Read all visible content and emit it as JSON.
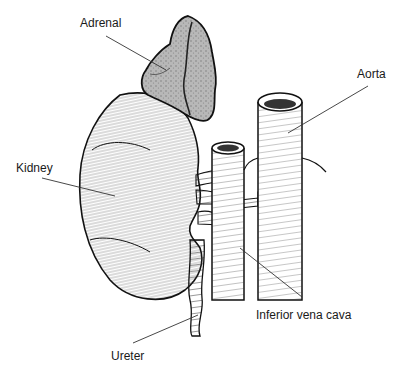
{
  "diagram": {
    "style": "black-and-white pen-and-ink anatomical illustration",
    "labels": [
      {
        "id": "adrenal",
        "text": "Adrenal",
        "x": 80,
        "y": 17,
        "pointer": [
          [
            106,
            36
          ],
          [
            166,
            70
          ]
        ]
      },
      {
        "id": "aorta",
        "text": "Aorta",
        "x": 357,
        "y": 68,
        "pointer": [
          [
            368,
            86
          ],
          [
            288,
            133
          ]
        ]
      },
      {
        "id": "kidney",
        "text": "Kidney",
        "x": 16,
        "y": 162,
        "pointer": [
          [
            42,
            178
          ],
          [
            115,
            196
          ]
        ]
      },
      {
        "id": "ivc",
        "text": "Inferior vena cava",
        "x": 256,
        "y": 309,
        "pointer": [
          [
            302,
            297
          ],
          [
            240,
            248
          ]
        ]
      },
      {
        "id": "ureter",
        "text": "Ureter",
        "x": 111,
        "y": 350,
        "pointer": [
          [
            133,
            343
          ],
          [
            198,
            315
          ]
        ]
      }
    ]
  },
  "colors": {
    "ink": "#111111",
    "adrenal_fill": "#9a9a9a",
    "adrenal_light": "#cfcfcf",
    "background": "#ffffff",
    "pointer_line": "#333333"
  }
}
